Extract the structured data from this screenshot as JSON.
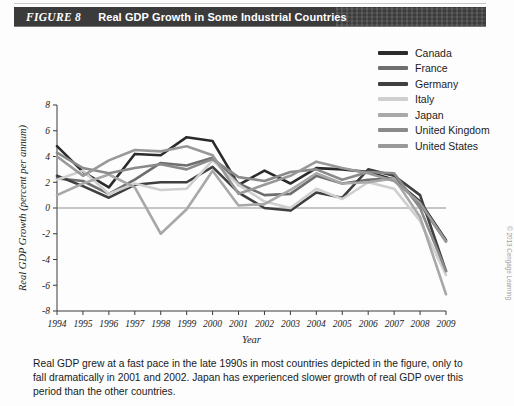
{
  "header": {
    "figure_number": "FIGURE 8",
    "title": "Real GDP Growth in Some Industrial Countries"
  },
  "caption": "Real GDP grew at a fast pace in the late 1990s in most countries depicted in the figure, only to fall dramatically in 2001 and 2002. Japan has experienced slower growth of real GDP over this period than the other countries.",
  "copyright": "© 2013 Cengage Learning",
  "legend": {
    "position": "top-right",
    "items": [
      {
        "label": "Canada",
        "color": "#2b2b2b"
      },
      {
        "label": "France",
        "color": "#6e6e6e"
      },
      {
        "label": "Germany",
        "color": "#3f3f3f"
      },
      {
        "label": "Italy",
        "color": "#cfcfcf"
      },
      {
        "label": "Japan",
        "color": "#a8a8a8"
      },
      {
        "label": "United Kingdom",
        "color": "#8a8a8a"
      },
      {
        "label": "United States",
        "color": "#999999"
      }
    ]
  },
  "chart_data": {
    "type": "line",
    "title": "Real GDP Growth in Some Industrial Countries",
    "xlabel": "Year",
    "ylabel": "Real GDP Growth (percent per annum)",
    "xlim": [
      1994,
      2009
    ],
    "ylim": [
      -8,
      8
    ],
    "ytick_step": 2,
    "yticks": [
      -8,
      -6,
      -4,
      -2,
      0,
      2,
      4,
      6,
      8
    ],
    "grid": false,
    "zero_line": true,
    "x": [
      1994,
      1995,
      1996,
      1997,
      1998,
      1999,
      2000,
      2001,
      2002,
      2003,
      2004,
      2005,
      2006,
      2007,
      2008,
      2009
    ],
    "categories": [
      "1994",
      "1995",
      "1996",
      "1997",
      "1998",
      "1999",
      "2000",
      "2001",
      "2002",
      "2003",
      "2004",
      "2005",
      "2006",
      "2007",
      "2008",
      "2009"
    ],
    "series": [
      {
        "name": "Canada",
        "color": "#2b2b2b",
        "values": [
          4.8,
          2.8,
          1.6,
          4.2,
          4.1,
          5.5,
          5.2,
          1.8,
          2.9,
          1.9,
          3.1,
          3.0,
          2.8,
          2.2,
          0.5,
          -2.5
        ]
      },
      {
        "name": "France",
        "color": "#6e6e6e",
        "values": [
          2.3,
          2.1,
          1.1,
          2.2,
          3.5,
          3.3,
          3.9,
          1.9,
          1.0,
          1.1,
          2.5,
          1.9,
          2.2,
          2.3,
          0.3,
          -2.6
        ]
      },
      {
        "name": "Germany",
        "color": "#3f3f3f",
        "values": [
          2.5,
          1.7,
          0.8,
          1.8,
          2.0,
          2.0,
          3.2,
          1.2,
          0.0,
          -0.2,
          1.2,
          0.8,
          3.0,
          2.5,
          1.0,
          -4.9
        ]
      },
      {
        "name": "Italy",
        "color": "#cfcfcf",
        "values": [
          2.2,
          2.9,
          1.1,
          1.9,
          1.4,
          1.5,
          3.7,
          1.8,
          0.5,
          0.0,
          1.5,
          0.7,
          2.0,
          1.5,
          -1.0,
          -5.2
        ]
      },
      {
        "name": "Japan",
        "color": "#a8a8a8",
        "values": [
          1.0,
          1.9,
          2.6,
          1.6,
          -2.0,
          -0.1,
          2.9,
          0.2,
          0.3,
          1.4,
          2.7,
          1.9,
          2.0,
          2.3,
          -0.7,
          -6.7
        ]
      },
      {
        "name": "United Kingdom",
        "color": "#8a8a8a",
        "values": [
          4.3,
          3.1,
          2.7,
          3.1,
          3.4,
          3.0,
          3.8,
          2.4,
          2.1,
          2.8,
          3.0,
          2.2,
          2.8,
          2.7,
          0.0,
          -4.9
        ]
      },
      {
        "name": "United States",
        "color": "#999999",
        "values": [
          4.0,
          2.5,
          3.7,
          4.5,
          4.4,
          4.8,
          4.1,
          1.1,
          1.8,
          2.5,
          3.6,
          3.1,
          2.7,
          2.1,
          0.4,
          -2.6
        ]
      }
    ]
  }
}
